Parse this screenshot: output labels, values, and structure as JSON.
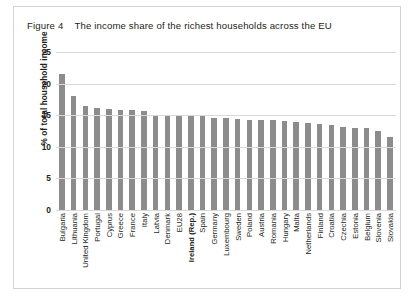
{
  "figure": {
    "number_label": "Figure 4",
    "title": "The income share of the richest households across the EU",
    "border_color": "#d2d2d2",
    "bar_color": "#8c8c8c",
    "gridline_color": "#d9d9d9",
    "text_color": "#231f20"
  },
  "chart_data": {
    "type": "bar",
    "title": "The income share of the richest households across the EU",
    "xlabel": "",
    "ylabel": "% of total household income",
    "ylim": [
      0,
      25
    ],
    "yticks": [
      0,
      5,
      10,
      15,
      20,
      25
    ],
    "ytick_labels": [
      "0",
      "5",
      "10",
      "15",
      "20",
      "25"
    ],
    "grid": true,
    "legend": "none",
    "orientation": "vertical",
    "highlighted_category": "Ireland (Rep.)",
    "categories": [
      "Bulgaria",
      "Lithuania",
      "United Kingdom",
      "Portugal",
      "Cyprus",
      "Greece",
      "France",
      "Italy",
      "Latvia",
      "Denmark",
      "EU28",
      "Ireland (Rep.)",
      "Spain",
      "Germany",
      "Luxembourg",
      "Sweden",
      "Poland",
      "Austria",
      "Romania",
      "Hungary",
      "Malta",
      "Netherlands",
      "Finland",
      "Croatia",
      "Czechia",
      "Estonia",
      "Belgium",
      "Slovenia",
      "Slovakia"
    ],
    "values": [
      21.6,
      18.0,
      16.4,
      16.2,
      16.0,
      15.8,
      15.8,
      15.7,
      15.1,
      15.0,
      14.9,
      14.8,
      14.8,
      14.6,
      14.5,
      14.4,
      14.3,
      14.2,
      14.2,
      14.1,
      13.9,
      13.8,
      13.6,
      13.4,
      13.1,
      13.0,
      12.9,
      12.5,
      11.5
    ]
  }
}
